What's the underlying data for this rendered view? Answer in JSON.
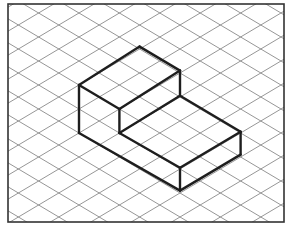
{
  "diagram": {
    "type": "isometric-drawing",
    "colors": {
      "background": "#ffffff",
      "frame": "#333333",
      "grid": "#8a8a8a",
      "solid_edges": "#1e1e1e"
    },
    "grid": {
      "style": "isometric-diamond",
      "line_directions": [
        "rising",
        "falling"
      ]
    },
    "solid": {
      "name": "stepped block",
      "parts": [
        {
          "name": "tall block",
          "iso_width": 2,
          "iso_depth": 3,
          "iso_height": 2
        },
        {
          "name": "low step",
          "iso_width": 3,
          "iso_depth": 3,
          "iso_height": 1
        }
      ]
    }
  }
}
